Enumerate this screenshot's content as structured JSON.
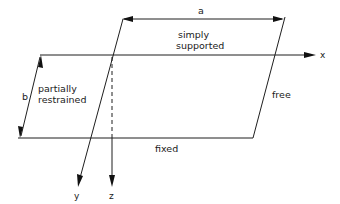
{
  "diagram": {
    "title": "",
    "dimensions": {
      "a": "a",
      "b": "b"
    },
    "edges": {
      "top": "simply supported",
      "top_line1": "simply",
      "top_line2": "supported",
      "left_line1": "partially",
      "left_line2": "restrained",
      "right": "free",
      "bottom": "fixed"
    },
    "axes": {
      "x": "x",
      "y": "y",
      "z": "z"
    },
    "colors": {
      "line": "#1f1f1f",
      "background": "#ffffff"
    }
  }
}
